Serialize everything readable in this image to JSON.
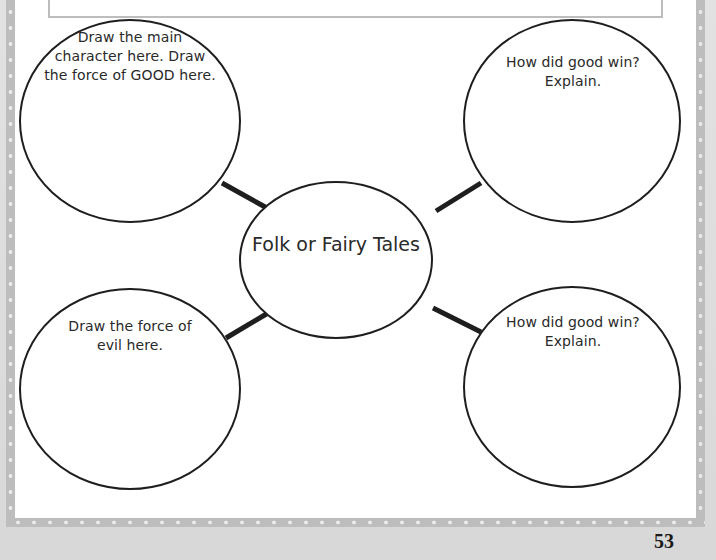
{
  "worksheet": {
    "center": {
      "title": "Folk or Fairy Tales"
    },
    "bubbles": [
      {
        "position": "top-left",
        "prompt_lines": [
          "Draw the main",
          "character here. Draw",
          "the force of GOOD here."
        ]
      },
      {
        "position": "top-right",
        "prompt_lines": [
          "How did good win?",
          "Explain."
        ]
      },
      {
        "position": "bottom-left",
        "prompt_lines": [
          "Draw the force of",
          "evil here."
        ]
      },
      {
        "position": "bottom-right",
        "prompt_lines": [
          "How did good win?",
          "Explain."
        ]
      }
    ],
    "page_number": "53"
  },
  "colors": {
    "line": "#1e1e1e",
    "frame": "#bdbdbd",
    "frame_dot": "#ececec",
    "paper": "#ffffff",
    "outer_background": "#dcdcdc",
    "text": "#2a2a2a"
  }
}
